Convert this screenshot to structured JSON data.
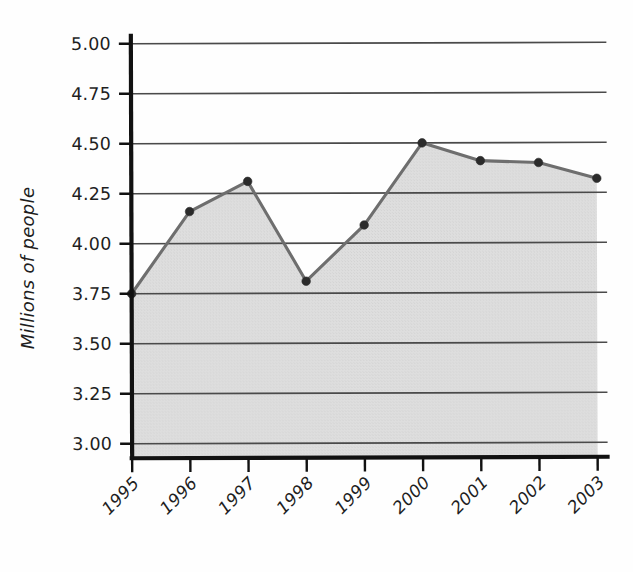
{
  "chart_data": {
    "type": "line",
    "title": "",
    "subtitle": "",
    "xlabel": "",
    "ylabel": "Millions of people",
    "categories": [
      "1995",
      "1996",
      "1997",
      "1998",
      "1999",
      "2000",
      "2001",
      "2002",
      "2003"
    ],
    "values": [
      3.75,
      4.16,
      4.31,
      3.81,
      4.09,
      4.5,
      4.41,
      4.4,
      4.32
    ],
    "series": [
      {
        "name": "Millions of people",
        "values": [
          3.75,
          4.16,
          4.31,
          3.81,
          4.09,
          4.5,
          4.41,
          4.4,
          4.32
        ]
      }
    ],
    "ylim": [
      3.0,
      5.0
    ],
    "ytick_labels": [
      "3.00",
      "3.25",
      "3.50",
      "3.75",
      "4.00",
      "4.25",
      "4.50",
      "4.75",
      "5.00"
    ],
    "ytick_values": [
      3.0,
      3.25,
      3.5,
      3.75,
      4.0,
      4.25,
      4.5,
      4.75,
      5.0
    ],
    "xtick_labels": [
      "1995",
      "1996",
      "1997",
      "1998",
      "1999",
      "2000",
      "2001",
      "2002",
      "2003"
    ],
    "grid": "horizontal",
    "legend": "none",
    "fill_below": true,
    "marker": "filled-circle",
    "annotations": [],
    "colors": {
      "line": "#6e6e6e",
      "marker": "#2b2b2b",
      "area_fill": "#dedede",
      "gridline": "#4a4a4a",
      "axis": "#111111",
      "background": "#fefefe",
      "text": "#1e1e1e"
    }
  }
}
